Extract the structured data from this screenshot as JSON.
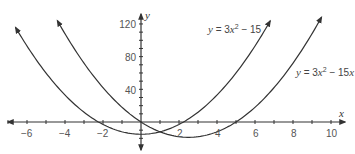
{
  "chart_data": {
    "type": "line",
    "title": "",
    "xlabel": "x",
    "ylabel": "y",
    "xlim": [
      -6.8,
      10.5
    ],
    "ylim": [
      -30,
      130
    ],
    "x_ticks": [
      -6,
      -4,
      -2,
      2,
      4,
      6,
      8,
      10
    ],
    "x_tick_labels": [
      "−6",
      "−4",
      "−2",
      "2",
      "4",
      "6",
      "8",
      "10"
    ],
    "y_ticks": [
      40,
      80,
      120
    ],
    "y_tick_labels": [
      "40",
      "80",
      "120"
    ],
    "grid": false,
    "legend": "inline labels",
    "series": [
      {
        "name": "y = 3x² − 15",
        "function": "3*x^2-15",
        "x_range": [
          -6.6,
          6.8
        ],
        "roots": [
          -2.24,
          2.24
        ],
        "vertex": [
          0,
          -15
        ]
      },
      {
        "name": "y = 3x² − 15x",
        "function": "3*x^2-15*x",
        "x_range": [
          -4.4,
          9.5
        ],
        "roots": [
          0,
          5
        ],
        "vertex": [
          2.5,
          -18.75
        ]
      }
    ],
    "annotations": [
      {
        "text": "y = 3x² − 15",
        "near": "right branch of first curve, upper"
      },
      {
        "text": "y = 3x² − 15x",
        "near": "right branch of second curve"
      }
    ]
  },
  "labels": {
    "x_axis": "x",
    "y_axis": "y",
    "eq1": {
      "y": "y",
      "mid": " = 3",
      "x": "x",
      "sup": "2",
      "tail": " − 15"
    },
    "eq2": {
      "y": "y",
      "mid": " = 3",
      "x": "x",
      "sup": "2",
      "tail": " − 15",
      "x2": "x"
    },
    "ticks": {
      "xm6": "−6",
      "xm4": "−4",
      "xm2": "−2",
      "x2": "2",
      "x4": "4",
      "x6": "6",
      "x8": "8",
      "x10": "10",
      "y40": "40",
      "y80": "80",
      "y120": "120"
    }
  },
  "colors": {
    "curve": "#333333",
    "axis": "#333333",
    "text": "#555555"
  }
}
